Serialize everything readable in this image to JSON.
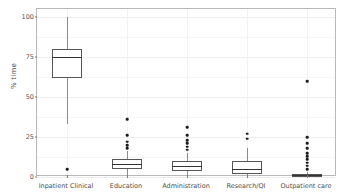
{
  "chart_data": {
    "type": "boxplot",
    "title": "",
    "xlabel": "",
    "ylabel": "% time",
    "ylim": [
      0,
      105
    ],
    "yticks": [
      0,
      25,
      50,
      75,
      100
    ],
    "ytick_labels": [
      "0",
      "25",
      "50",
      "75",
      "100"
    ],
    "grid": true,
    "legend": "none",
    "categories": [
      "Inpatient Clinical",
      "Education",
      "Administration",
      "Research/QI",
      "Outpatient care"
    ],
    "boxes": [
      {
        "category": "Inpatient Clinical",
        "whisker_low": 33,
        "q1": 62,
        "median": 75,
        "q3": 80,
        "whisker_high": 100,
        "outliers": [
          5
        ]
      },
      {
        "category": "Education",
        "whisker_low": 0,
        "q1": 5,
        "median": 8,
        "q3": 11,
        "whisker_high": 16,
        "outliers": [
          18,
          20,
          22,
          26,
          36
        ]
      },
      {
        "category": "Administration",
        "whisker_low": 0,
        "q1": 4,
        "median": 7,
        "q3": 10,
        "whisker_high": 15,
        "outliers": [
          17,
          19,
          21,
          23,
          26,
          31
        ]
      },
      {
        "category": "Research/QI",
        "whisker_low": 0,
        "q1": 2,
        "median": 5,
        "q3": 10,
        "whisker_high": 18,
        "outliers": [
          24,
          27
        ]
      },
      {
        "category": "Outpatient care",
        "whisker_low": 0,
        "q1": 0,
        "median": 1,
        "q3": 2,
        "whisker_high": 3,
        "outliers": [
          5,
          7,
          9,
          11,
          13,
          15,
          18,
          21,
          25,
          60
        ]
      }
    ]
  },
  "colors": {
    "box_line": "#555555",
    "median_line": "#333333",
    "whisker": "#8c8c8c",
    "outlier": "#1a1a1a",
    "panel_border": "#b8b8b8",
    "grid": "#ededed",
    "background": "#ffffff",
    "axis_text": "#4d4d4d"
  }
}
